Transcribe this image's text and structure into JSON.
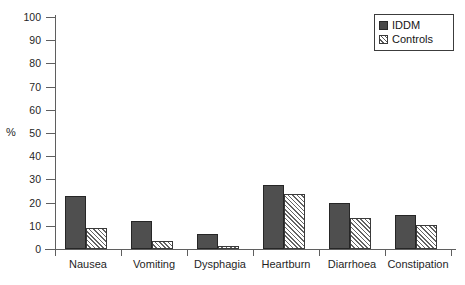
{
  "chart_data": {
    "type": "bar",
    "title": "",
    "xlabel": "",
    "ylabel": "%",
    "ylim": [
      0,
      100
    ],
    "yticks": [
      0,
      10,
      20,
      30,
      40,
      50,
      60,
      70,
      80,
      90,
      100
    ],
    "grid": false,
    "legend_position": "top-right",
    "categories": [
      "Nausea",
      "Vomiting",
      "Dysphagia",
      "Heartburn",
      "Diarrhoea",
      "Constipation"
    ],
    "series": [
      {
        "name": "IDDM",
        "fill": "solid-dark",
        "color": "#4f4f4f",
        "values": [
          23,
          12,
          6.5,
          27.5,
          20,
          14.5
        ]
      },
      {
        "name": "Controls",
        "fill": "diagonal-hatch",
        "color": "#ffffff",
        "values": [
          9,
          3.5,
          1.5,
          23.5,
          13.5,
          10.5
        ]
      }
    ]
  },
  "legend": {
    "items": [
      {
        "label": "IDDM",
        "swatch": "solid-square-icon"
      },
      {
        "label": "Controls",
        "swatch": "hatched-square-icon"
      }
    ]
  },
  "axis": {
    "y_label": "%",
    "y_tick_labels": [
      "100",
      "90",
      "80",
      "70",
      "60",
      "50",
      "40",
      "30",
      "20",
      "10",
      "0"
    ],
    "x_tick_labels": [
      "Nausea",
      "Vomiting",
      "Dysphagia",
      "Heartburn",
      "Diarrhoea",
      "Constipation"
    ]
  }
}
